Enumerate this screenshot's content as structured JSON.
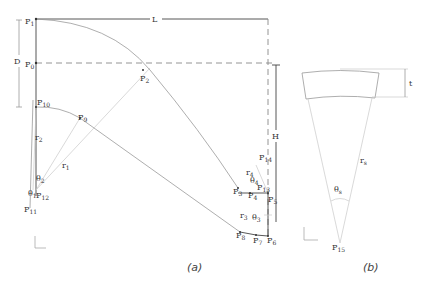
{
  "figure": {
    "panel_a": {
      "caption": "(a)",
      "dimensions": {
        "L": "L",
        "D": "D",
        "H": "H"
      },
      "points": {
        "p0": {
          "base": "P",
          "sub": "0"
        },
        "p1": {
          "base": "P",
          "sub": "1"
        },
        "p2": {
          "base": "P",
          "sub": "2"
        },
        "p3": {
          "base": "P",
          "sub": "3"
        },
        "p4": {
          "base": "P",
          "sub": "4"
        },
        "p5": {
          "base": "P",
          "sub": "5"
        },
        "p6": {
          "base": "P",
          "sub": "6"
        },
        "p7": {
          "base": "P",
          "sub": "7"
        },
        "p8": {
          "base": "P",
          "sub": "8"
        },
        "p9": {
          "base": "P",
          "sub": "9"
        },
        "p10": {
          "base": "P",
          "sub": "10"
        },
        "p11": {
          "base": "P",
          "sub": "11"
        },
        "p12": {
          "base": "P",
          "sub": "12"
        },
        "p13": {
          "base": "P",
          "sub": "13"
        },
        "p14": {
          "base": "P",
          "sub": "14"
        }
      },
      "radii": {
        "r1": {
          "base": "r",
          "sub": "1"
        },
        "r2": {
          "base": "r",
          "sub": "2"
        },
        "r3": {
          "base": "r",
          "sub": "3"
        },
        "r4": {
          "base": "r",
          "sub": "4"
        }
      },
      "angles": {
        "theta1": {
          "base": "θ",
          "sub": "1"
        },
        "theta2": {
          "base": "θ",
          "sub": "2"
        },
        "theta3": {
          "base": "θ",
          "sub": "3"
        },
        "theta4": {
          "base": "θ",
          "sub": "4"
        }
      },
      "axes": {
        "y": "y",
        "x": "x"
      }
    },
    "panel_b": {
      "caption": "(b)",
      "dimension_t": "t",
      "radius": {
        "base": "r",
        "sub": "s"
      },
      "angle": {
        "base": "θ",
        "sub": "s"
      },
      "point": {
        "base": "P",
        "sub": "15"
      },
      "axes": {
        "y": "y",
        "x": "x"
      }
    }
  }
}
